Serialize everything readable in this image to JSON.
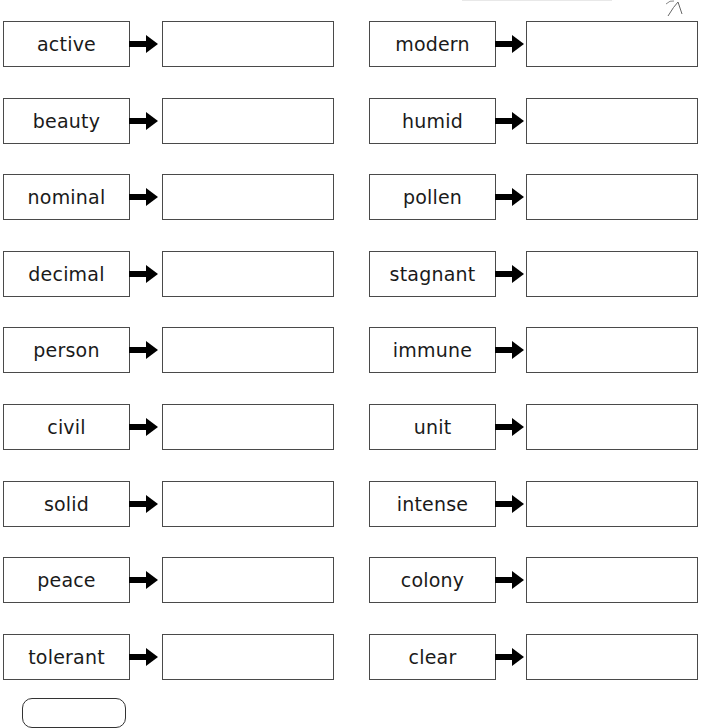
{
  "worksheet": {
    "arrow_icon": "right-arrow-icon",
    "colors": {
      "border": "#4a4a4a",
      "text": "#1a1a1a",
      "arrow": "#000000",
      "background": "#ffffff"
    },
    "left_column": [
      {
        "word": "active",
        "answer": ""
      },
      {
        "word": "beauty",
        "answer": ""
      },
      {
        "word": "nominal",
        "answer": ""
      },
      {
        "word": "decimal",
        "answer": ""
      },
      {
        "word": "person",
        "answer": ""
      },
      {
        "word": "civil",
        "answer": ""
      },
      {
        "word": "solid",
        "answer": ""
      },
      {
        "word": "peace",
        "answer": ""
      },
      {
        "word": "tolerant",
        "answer": ""
      }
    ],
    "right_column": [
      {
        "word": "modern",
        "answer": ""
      },
      {
        "word": "humid",
        "answer": ""
      },
      {
        "word": "pollen",
        "answer": ""
      },
      {
        "word": "stagnant",
        "answer": ""
      },
      {
        "word": "immune",
        "answer": ""
      },
      {
        "word": "unit",
        "answer": ""
      },
      {
        "word": "intense",
        "answer": ""
      },
      {
        "word": "colony",
        "answer": ""
      },
      {
        "word": "clear",
        "answer": ""
      }
    ]
  }
}
